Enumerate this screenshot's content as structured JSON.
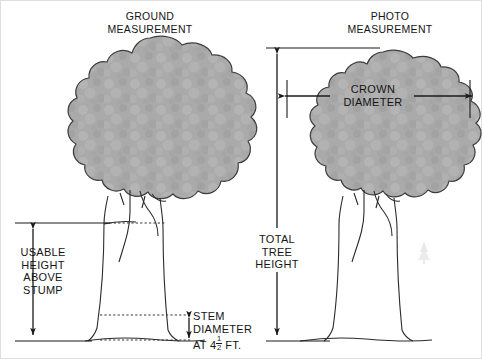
{
  "figure": {
    "title_ground": "GROUND\nMEASUREMENT",
    "title_photo": "PHOTO\nMEASUREMENT",
    "border_color": "#d8d8d8",
    "background": "#ffffff"
  },
  "labels": {
    "usable_height": "USABLE\nHEIGHT\nABOVE\nSTUMP",
    "stem_diameter_line1": "STEM",
    "stem_diameter_line2": "DIAMETER",
    "stem_diameter_line3_pre": "AT 4",
    "stem_diameter_fraction_num": "1",
    "stem_diameter_fraction_den": "2",
    "stem_diameter_line3_post": " FT.",
    "total_tree_height": "TOTAL\nTREE\nHEIGHT",
    "crown_diameter": "CROWN\nDIAMETER"
  },
  "colors": {
    "crown_fill": "#aaaaaa",
    "crown_stroke": "#3a3a3a",
    "line": "#1a1a1a",
    "trunk_stroke": "#2b2b2b",
    "dotted": "#333333",
    "faint_shrub": "#dadada"
  },
  "diagram_data": {
    "type": "illustration",
    "subject": "tree measurement comparison diagram",
    "panels": [
      {
        "name": "ground-measurement",
        "measurements": [
          "USABLE HEIGHT ABOVE STUMP",
          "STEM DIAMETER AT 4 1/2 FT."
        ]
      },
      {
        "name": "photo-measurement",
        "measurements": [
          "TOTAL TREE HEIGHT",
          "CROWN DIAMETER"
        ]
      }
    ]
  }
}
